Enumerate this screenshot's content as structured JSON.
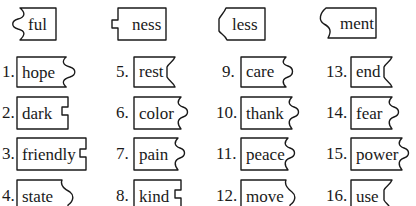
{
  "suffixes": [
    {
      "label": "ful",
      "edge": "wave"
    },
    {
      "label": "ness",
      "edge": "notch"
    },
    {
      "label": "less",
      "edge": "angled"
    },
    {
      "label": "ment",
      "edge": "s-curve"
    }
  ],
  "words": [
    {
      "num": "1.",
      "label": "hope",
      "edge": "wave"
    },
    {
      "num": "2.",
      "label": "dark",
      "edge": "notch"
    },
    {
      "num": "3.",
      "label": "friendly",
      "edge": "notch"
    },
    {
      "num": "4.",
      "label": "state",
      "edge": "s-curve"
    },
    {
      "num": "5.",
      "label": "rest",
      "edge": "angled"
    },
    {
      "num": "6.",
      "label": "color",
      "edge": "wave"
    },
    {
      "num": "7.",
      "label": "pain",
      "edge": "wave"
    },
    {
      "num": "8.",
      "label": "kind",
      "edge": "notch"
    },
    {
      "num": "9.",
      "label": "care",
      "edge": "wave"
    },
    {
      "num": "10.",
      "label": "thank",
      "edge": "wave"
    },
    {
      "num": "11.",
      "label": "peace",
      "edge": "wave"
    },
    {
      "num": "12.",
      "label": "move",
      "edge": "s-curve"
    },
    {
      "num": "13.",
      "label": "end",
      "edge": "angled"
    },
    {
      "num": "14.",
      "label": "fear",
      "edge": "wave"
    },
    {
      "num": "15.",
      "label": "power",
      "edge": "wave"
    },
    {
      "num": "16.",
      "label": "use",
      "edge": "angled"
    }
  ]
}
